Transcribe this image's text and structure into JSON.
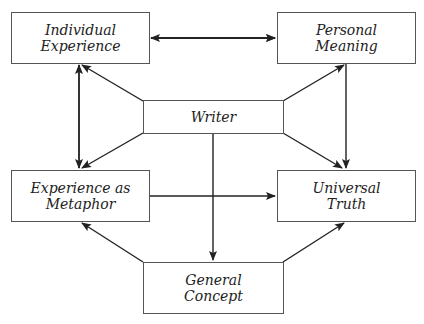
{
  "diagram": {
    "nodes": {
      "individual_experience": {
        "label": "Individual\nExperience"
      },
      "personal_meaning": {
        "label": "Personal\nMeaning"
      },
      "writer": {
        "label": "Writer"
      },
      "experience_as_metaphor": {
        "label": "Experience as\nMetaphor"
      },
      "universal_truth": {
        "label": "Universal\nTruth"
      },
      "general_concept": {
        "label": "General\nConcept"
      }
    },
    "edges": [
      {
        "from": "individual_experience",
        "to": "personal_meaning",
        "type": "bidirectional"
      },
      {
        "from": "individual_experience",
        "to": "experience_as_metaphor",
        "type": "bidirectional"
      },
      {
        "from": "writer",
        "to": "individual_experience",
        "type": "directed"
      },
      {
        "from": "writer",
        "to": "personal_meaning",
        "type": "directed"
      },
      {
        "from": "writer",
        "to": "experience_as_metaphor",
        "type": "directed"
      },
      {
        "from": "writer",
        "to": "universal_truth",
        "type": "directed"
      },
      {
        "from": "writer",
        "to": "general_concept",
        "type": "directed"
      },
      {
        "from": "personal_meaning",
        "to": "universal_truth",
        "type": "directed"
      },
      {
        "from": "experience_as_metaphor",
        "to": "universal_truth",
        "type": "directed"
      },
      {
        "from": "general_concept",
        "to": "experience_as_metaphor",
        "type": "directed"
      },
      {
        "from": "general_concept",
        "to": "universal_truth",
        "type": "directed"
      }
    ],
    "colors": {
      "line": "#222222",
      "border": "#555555",
      "background": "#ffffff"
    }
  }
}
